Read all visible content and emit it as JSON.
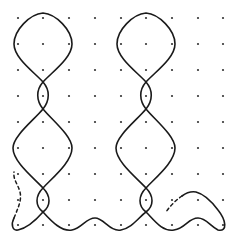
{
  "diagram": {
    "type": "dot-grid line drawing (kolam-style)",
    "background": "#ffffff",
    "stroke_color": "#1a1a1a",
    "dot_color": "#333333",
    "grid": {
      "columns": 9,
      "rows": 9,
      "x_positions": [
        18,
        43,
        69,
        95,
        121,
        146,
        172,
        198,
        223
      ],
      "y_positions": [
        18,
        44,
        70,
        96,
        122,
        148,
        174,
        200,
        225
      ]
    },
    "figures": [
      {
        "name": "left-twisted-loop-figure",
        "center_x": 43
      },
      {
        "name": "right-twisted-loop-figure",
        "center_x": 146
      }
    ],
    "dashed_segments": [
      {
        "name": "left-dashed-continuation",
        "description": "dashed wavy line rising from bottom-left curl"
      },
      {
        "name": "right-dashed-continuation",
        "description": "dashed line rising from lower-right toward hook"
      }
    ],
    "bottom_wave": {
      "description": "solid wavy line running along the bottom row connecting both figures and ending in a hook at right"
    }
  }
}
